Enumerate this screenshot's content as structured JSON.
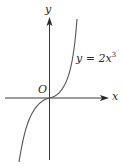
{
  "figure": {
    "y_axis_label": "y",
    "x_axis_label": "x",
    "origin_label": "O",
    "equation": {
      "lhs": "y = 2x",
      "exponent": "3"
    },
    "colors": {
      "axis": "#3a3a3a",
      "curve": "#555555",
      "text": "#2a2a2a"
    }
  }
}
